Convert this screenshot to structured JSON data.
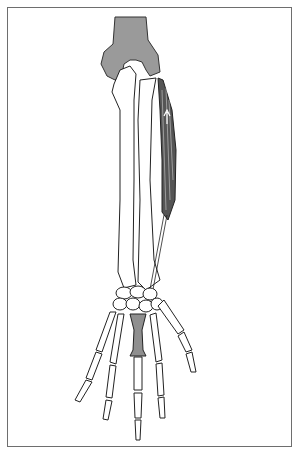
{
  "figure": {
    "colors": {
      "frame": "#6e6e6e",
      "bone_outline": "#222222",
      "humerus_fill": "#9a9a9a",
      "muscle_fill": "#555555",
      "highlight_bone": "#8f8f8f",
      "background": "#ffffff"
    }
  }
}
